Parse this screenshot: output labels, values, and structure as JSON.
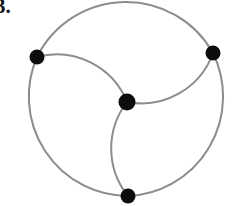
{
  "figure": {
    "label": "3.",
    "background_color": "#ffffff",
    "stroke_color": "#8c8c8c",
    "vertex_color": "#0d0d0d",
    "label_color": "#111111",
    "width": 232,
    "height": 206
  },
  "chart_data": {
    "type": "diagram",
    "title": "3.",
    "xlabel": "",
    "ylabel": "",
    "canvas": {
      "width": 232,
      "height": 206
    },
    "outer_circle": {
      "cx": 126.5,
      "cy": 102.5,
      "r": 99.5
    },
    "vertices": [
      {
        "id": "A",
        "name": "left-vertex",
        "x": 37,
        "y": 57,
        "r": 7.5
      },
      {
        "id": "B",
        "name": "right-vertex",
        "x": 213,
        "y": 53,
        "r": 7.5
      },
      {
        "id": "C",
        "name": "bottom-vertex",
        "x": 128,
        "y": 196,
        "r": 7.5
      },
      {
        "id": "D",
        "name": "center-vertex",
        "x": 127,
        "y": 102,
        "r": 8.5
      }
    ],
    "edges": [
      {
        "from": "A",
        "to": "B",
        "kind": "outer-arc",
        "path": "M 37 57 A 99.5 99.5 0 0 1 213 53"
      },
      {
        "from": "B",
        "to": "C",
        "kind": "outer-arc",
        "path": "M 213 53 A 99.5 99.5 0 0 1 128 196"
      },
      {
        "from": "C",
        "to": "A",
        "kind": "outer-arc",
        "path": "M 128 196 A 99.5 99.5 0 0 1 37 57"
      },
      {
        "from": "A",
        "to": "D",
        "kind": "inner-arc",
        "path": "M 37 57 A 76 76 0 0 1 127 102"
      },
      {
        "from": "B",
        "to": "D",
        "kind": "inner-arc",
        "path": "M 213 53 A 76 76 0 0 1 127 102"
      },
      {
        "from": "C",
        "to": "D",
        "kind": "inner-arc",
        "path": "M 128 196 A 76 76 0 0 1 127 102"
      }
    ],
    "vertex_count": 4,
    "edge_count": 6,
    "degrees": {
      "A": 3,
      "B": 3,
      "C": 3,
      "D": 3
    },
    "grid": false,
    "legend": null
  }
}
